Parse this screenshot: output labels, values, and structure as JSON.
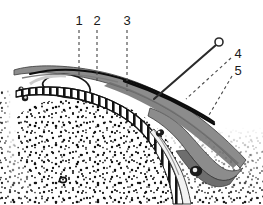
{
  "figure": {
    "type": "anatomical-cross-section-line-drawing",
    "background_color": "#ffffff",
    "ink_color": "#1a1a1a",
    "tissue_gray": "#8c8c8c",
    "tissue_gray_dark": "#6e6e6e",
    "tissue_gray_light": "#b8b8b8",
    "stipple_color": "#111111"
  },
  "callouts": [
    {
      "id": "1",
      "label": "1",
      "label_x": 79,
      "label_y": 22,
      "leader_type": "dashed-vertical",
      "leader_x1": 79,
      "leader_y1": 30,
      "leader_x2": 79,
      "leader_y2": 76
    },
    {
      "id": "2",
      "label": "2",
      "label_x": 97,
      "label_y": 22,
      "leader_type": "dashed-vertical",
      "leader_x1": 97,
      "leader_y1": 30,
      "leader_x2": 97,
      "leader_y2": 82
    },
    {
      "id": "3",
      "label": "3",
      "label_x": 127,
      "label_y": 22,
      "leader_type": "dashed-vertical",
      "leader_x1": 127,
      "leader_y1": 30,
      "leader_x2": 127,
      "leader_y2": 91
    },
    {
      "id": "4",
      "label": "4",
      "label_x": 238,
      "label_y": 55,
      "leader_type": "dashed-diagonal",
      "leader_x1": 231,
      "leader_y1": 58,
      "leader_x2": 186,
      "leader_y2": 99
    },
    {
      "id": "5",
      "label": "5",
      "label_x": 238,
      "label_y": 72,
      "leader_type": "dashed-diagonal",
      "leader_x1": 232,
      "leader_y1": 76,
      "leader_x2": 209,
      "leader_y2": 115
    }
  ],
  "needle": {
    "name": "needle",
    "head_cx": 219,
    "head_cy": 42,
    "head_r": 4,
    "shaft_x1": 216,
    "shaft_y1": 45,
    "shaft_x2": 154,
    "shaft_y2": 99
  },
  "structures": [
    {
      "name": "outer-skin-line",
      "kind": "thin-black-curve"
    },
    {
      "name": "upper-soft-tissue-band",
      "kind": "gray-filled-band"
    },
    {
      "name": "elliptical-cavity",
      "kind": "open-loop"
    },
    {
      "name": "hatched-periosteal-band",
      "kind": "ladder-hatch"
    },
    {
      "name": "cancellous-bone-stipple",
      "kind": "stipple-field"
    },
    {
      "name": "lower-gray-wedge",
      "kind": "gray-filled-wedge"
    },
    {
      "name": "dark-vessel-node",
      "kind": "dark-blob"
    }
  ]
}
